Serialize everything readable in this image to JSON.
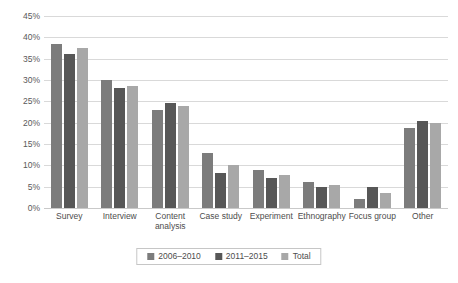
{
  "chart_data": {
    "type": "bar",
    "title": "",
    "xlabel": "",
    "ylabel": "",
    "ylim": [
      0,
      45
    ],
    "ytick_step": 5,
    "grid": true,
    "legend_position": "bottom",
    "ytick_labels": [
      "0%",
      "5%",
      "10%",
      "15%",
      "20%",
      "25%",
      "30%",
      "35%",
      "40%",
      "45%"
    ],
    "categories": [
      "Survey",
      "Interview",
      "Content analysis",
      "Case study",
      "Experiment",
      "Ethnography",
      "Focus group",
      "Other"
    ],
    "series": [
      {
        "name": "2006–2010",
        "color": "#7c7c7c",
        "values": [
          38.5,
          30.0,
          23.0,
          13.0,
          9.0,
          6.0,
          2.0,
          18.7
        ]
      },
      {
        "name": "2011–2015",
        "color": "#575757",
        "values": [
          36.0,
          28.2,
          24.5,
          8.3,
          7.0,
          5.0,
          5.0,
          20.5
        ]
      },
      {
        "name": "Total",
        "color": "#a8a8a8",
        "values": [
          37.5,
          28.5,
          23.8,
          10.0,
          7.8,
          5.3,
          3.5,
          20.0
        ]
      }
    ]
  }
}
